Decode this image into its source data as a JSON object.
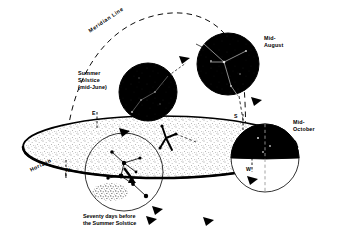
{
  "figure": {
    "background_color": "#ffffff",
    "ink_color": "#000000"
  },
  "labels": {
    "meridian_line": "Meridian Line",
    "summer_solstice": "Summer\nSolstice\n(mid-June)",
    "mid_august": "Mid-\nAugust",
    "mid_october": "Mid-\nOctober",
    "horizon": "Horizon",
    "caption": "Seventy days before\nthe Summer Solstice"
  },
  "cardinal_points": [
    {
      "id": "east",
      "label": "E"
    },
    {
      "id": "south",
      "label": "S"
    },
    {
      "id": "north",
      "label": "N"
    },
    {
      "id": "west",
      "label": "W"
    }
  ],
  "sky_positions": [
    {
      "id": "summer-solstice-disk",
      "label": "Summer Solstice (mid-June)",
      "fill": "#000000",
      "above_horizon": true
    },
    {
      "id": "mid-august-disk",
      "label": "Mid-August",
      "fill": "#000000",
      "above_horizon": true
    },
    {
      "id": "mid-october-disk",
      "label": "Mid-October",
      "fill": "#000000",
      "above_horizon": false
    },
    {
      "id": "seventy-days-disk",
      "label": "Seventy days before the Summer Solstice",
      "fill": "#ffffff",
      "above_horizon": true
    }
  ]
}
